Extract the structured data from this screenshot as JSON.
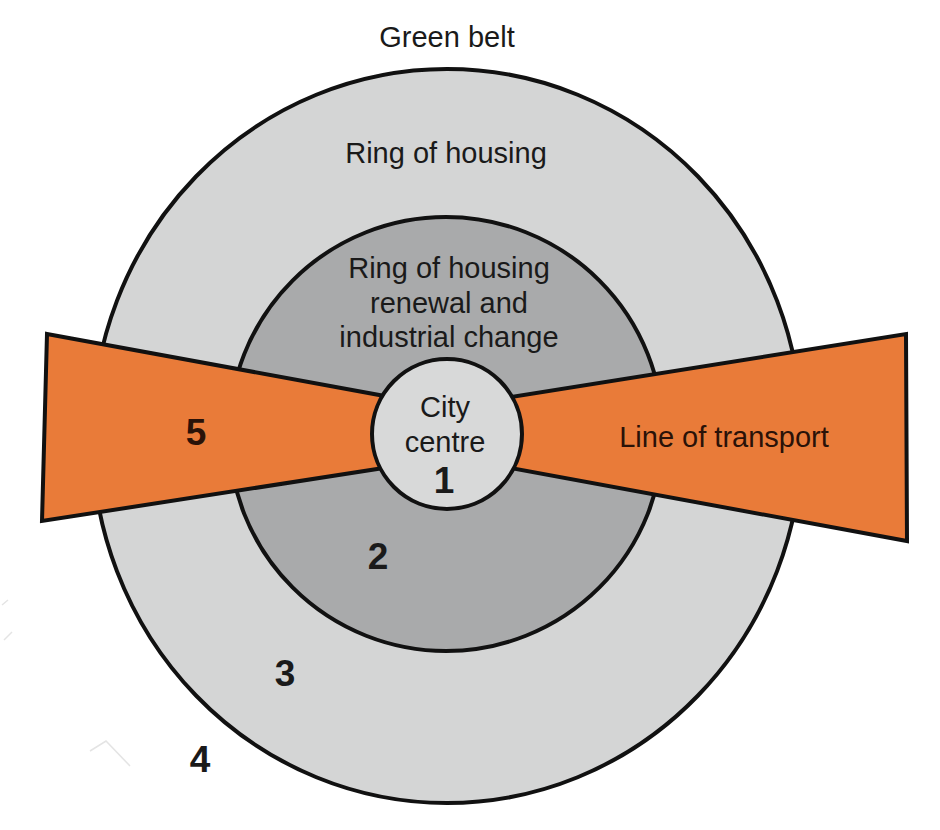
{
  "colors": {
    "background": "#ffffff",
    "outer_ring": "#d4d5d5",
    "middle_ring": "#a9aaab",
    "city_centre": "#d8d9d9",
    "transport": "#e97b39",
    "outline": "#111111",
    "text": "#1a1a1a",
    "transport_text": "#2a1208"
  },
  "labels": {
    "green_belt": "Green belt",
    "ring_of_housing": "Ring of housing",
    "renewal_ring": [
      "Ring of housing",
      "renewal and",
      "industrial change"
    ],
    "city_centre": [
      "City",
      "centre"
    ],
    "line_of_transport": "Line of transport"
  },
  "zones": [
    {
      "number": "1",
      "name": "City centre"
    },
    {
      "number": "2",
      "name": "Ring of housing renewal and industrial change"
    },
    {
      "number": "3",
      "name": "Ring of housing"
    },
    {
      "number": "4",
      "name": "Green belt"
    },
    {
      "number": "5",
      "name": "Line of transport"
    }
  ]
}
